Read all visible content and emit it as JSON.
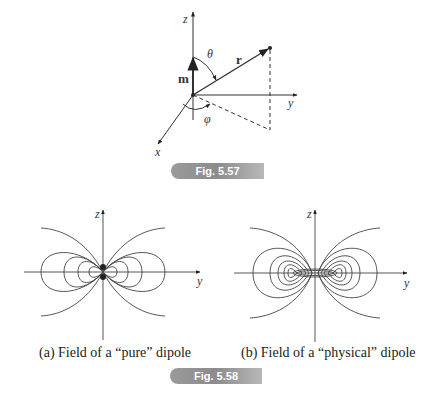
{
  "figure_5_57": {
    "badge": "Fig. 5.57",
    "labels": {
      "z_axis": "z",
      "y_axis": "y",
      "x_axis": "x",
      "moment_vector": "m",
      "position_vector": "r",
      "polar_angle": "θ",
      "azimuthal_angle": "φ"
    }
  },
  "figure_5_58": {
    "badge": "Fig. 5.58",
    "panels": [
      {
        "caption": "(a) Field of a “pure” dipole",
        "z_label": "z",
        "y_label": "y"
      },
      {
        "caption": "(b) Field of a “physical” dipole",
        "z_label": "z",
        "y_label": "y"
      }
    ]
  },
  "colors": {
    "line": "#333333",
    "badge_gray": "#9a9a9a"
  }
}
